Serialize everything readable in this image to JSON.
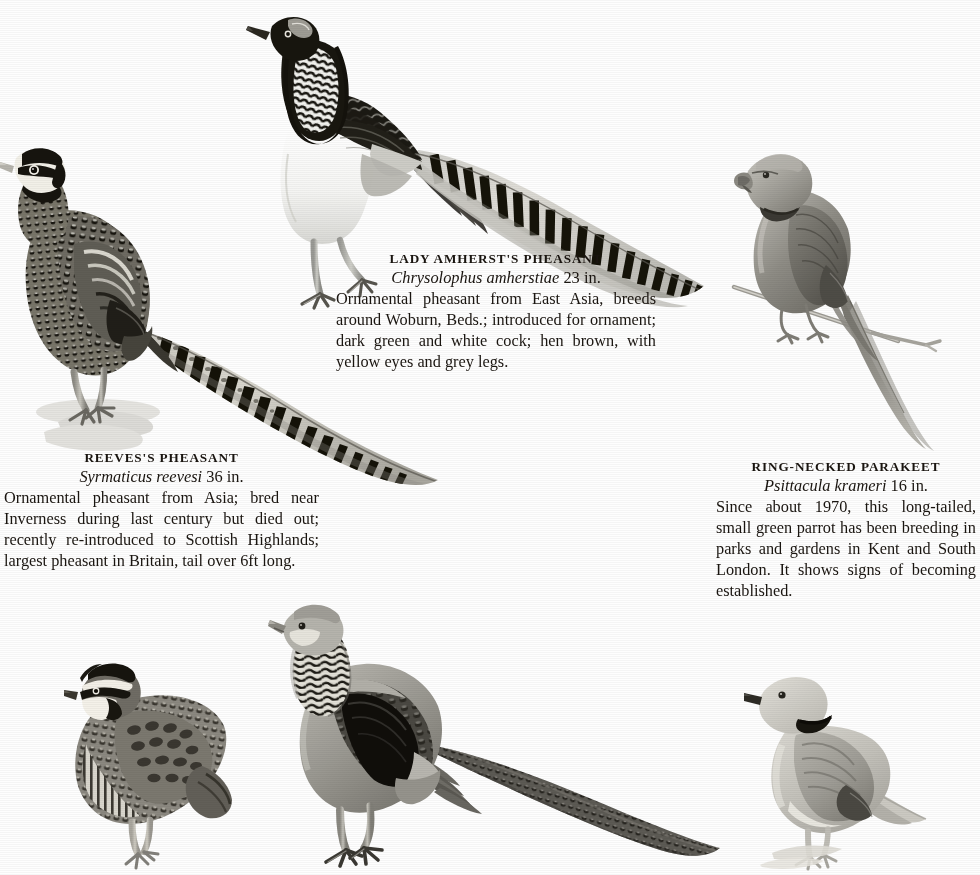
{
  "page": {
    "kind": "field-guide-plate",
    "background_color": "#fefefe",
    "ink_color": "#1a1510"
  },
  "captions": [
    {
      "id": "amherst",
      "common_name": "LADY AMHERST'S PHEASANT",
      "latin_name": "Chrysolophus amherstiae",
      "length": "23 in.",
      "body": "Ornamental pheasant from East Asia, breeds around Woburn, Beds.; intro­duced for ornament; dark green and white cock; hen brown, with yellow eyes and grey legs."
    },
    {
      "id": "reeves",
      "common_name": "REEVES'S PHEASANT",
      "latin_name": "Syrmaticus reevesi",
      "length": "36 in.",
      "body": "Ornamental pheasant from Asia; bred near Inverness during last century but died out; recently re-introduced to Scottish Highlands; largest pheasant in Britain, tail over 6ft long."
    },
    {
      "id": "parakeet",
      "common_name": "RING-NECKED PARAKEET",
      "latin_name": "Psittacula krameri",
      "length": "16 in.",
      "body": "Since about 1970, this long-tailed, small green parrot has been breeding in parks and gardens in Kent and South London. It shows signs of becoming established."
    }
  ],
  "illustrations": [
    {
      "id": "amherst",
      "name": "lady-amherst-pheasant-illustration",
      "subject": "Lady Amherst's Pheasant cock standing, very long barred tail sweeping right and down",
      "plumage": "black and white barred cape, white breast, dark mantle, long white tail with black bars"
    },
    {
      "id": "reeves",
      "name": "reeves-pheasant-illustration",
      "subject": "Reeves's Pheasant cock standing on stony ground, extremely long barred tail sweeping down to the right",
      "plumage": "white head with black mask and collar, scaled body, very long white tail with black bars"
    },
    {
      "id": "parakeet",
      "name": "ring-necked-parakeet-illustration",
      "subject": "Ring-necked Parakeet perched on a thin twig, very long pointed tail hanging down",
      "plumage": "uniform green with dark neck ring and hooked red bill"
    },
    {
      "id": "bobwhite",
      "name": "bobwhite-quail-illustration",
      "subject": "Small quail standing, plump body, short tail",
      "plumage": "white throat and eyebrow with black border, mottled brown body"
    },
    {
      "id": "cheer",
      "name": "golden-pheasant-hen-illustration",
      "subject": "Long-tailed pheasant standing, greyish body, barred neck, long mottled tail sweeping right",
      "plumage": "grey body, barred neck, black wing patch, long mottled brown tail"
    },
    {
      "id": "dove",
      "name": "collared-dove-illustration",
      "subject": "Collared dove perched, facing left",
      "plumage": "pale grey-buff with black half-collar on hind neck"
    }
  ]
}
